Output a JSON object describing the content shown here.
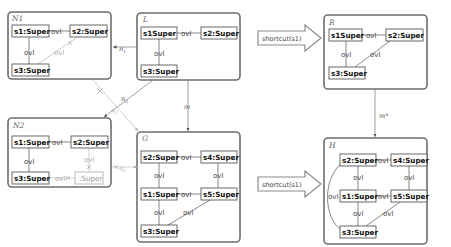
{
  "graphs": {
    "N1": {
      "title": "N1",
      "nodes": [
        "s1:Super",
        "s2:Super",
        "s3:Super"
      ],
      "edge_label": "ovl"
    },
    "L": {
      "title": "L",
      "nodes": [
        "s1Super",
        "s2:Super",
        "s3:Super"
      ],
      "edge_label": "ovl"
    },
    "R": {
      "title": "R",
      "nodes": [
        "s1Super",
        "s2:Super",
        "s3:Super"
      ],
      "edge_label": "ovl"
    },
    "N2": {
      "title": "N2",
      "nodes": [
        "s1:Super",
        "s2:Super",
        "s3:Super",
        ":Super"
      ],
      "edge_label": "ovl"
    },
    "G": {
      "title": "G",
      "nodes": [
        "s2:Super",
        "s4:Super",
        "s1:Super",
        "s5:Super",
        "s3:Super"
      ],
      "edge_label": "ovl"
    },
    "H": {
      "title": "H",
      "nodes": [
        "s2:Super",
        "s4:Super",
        "s1:Super",
        "s5:Super",
        "s3:Super"
      ],
      "edge_label": "ovl"
    }
  },
  "morphisms": {
    "n1": "n",
    "n1_sub": "1",
    "n2": "n",
    "n2_sub": "2",
    "m": "m",
    "m_star": "m*",
    "q1": "q",
    "q1_sub": "1",
    "q2": "q",
    "q2_sub": "2"
  },
  "transformations": [
    {
      "label": "shortcut(s1)"
    },
    {
      "label": "shortcut(s1)"
    }
  ],
  "colors": {
    "frame": "#6e6e6e",
    "node_border": "#444444",
    "faded": "#aaaaaa"
  }
}
